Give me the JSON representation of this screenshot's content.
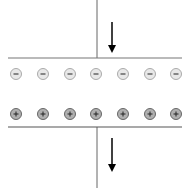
{
  "diagram": {
    "negative_charge_symbol": "-",
    "positive_charge_symbol": "+",
    "negative_charges": [
      16,
      43,
      70,
      96,
      123,
      150,
      176
    ],
    "positive_charges": [
      16,
      43,
      70,
      96,
      123,
      150,
      176
    ],
    "colors": {
      "line": "#555555",
      "negative_fill": "#e8e8e8",
      "positive_fill": "#b0b0b0",
      "arrow": "#000000"
    }
  }
}
